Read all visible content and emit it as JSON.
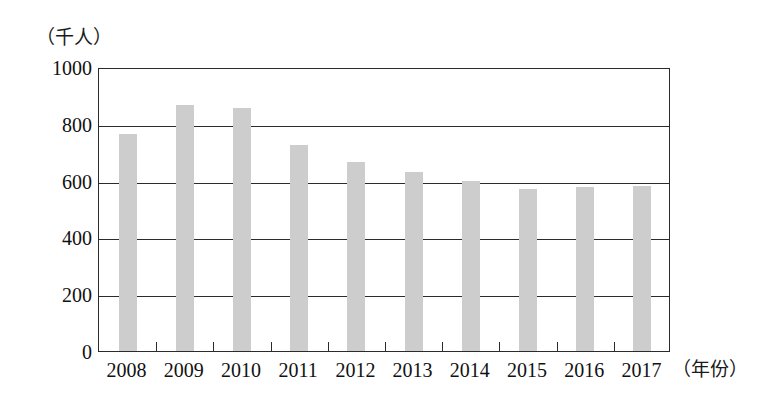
{
  "chart_data": {
    "type": "bar",
    "title": "",
    "subtitle": "",
    "xlabel": "（年份）",
    "ylabel": "（千人）",
    "categories": [
      "2008",
      "2009",
      "2010",
      "2011",
      "2012",
      "2013",
      "2014",
      "2015",
      "2016",
      "2017"
    ],
    "values": [
      765,
      865,
      855,
      725,
      665,
      630,
      600,
      570,
      578,
      580
    ],
    "series": [
      {
        "name": "人数",
        "values": [
          765,
          865,
          855,
          725,
          665,
          630,
          600,
          570,
          578,
          580
        ]
      }
    ],
    "ylim": [
      0,
      1000
    ],
    "yticks": [
      0,
      200,
      400,
      600,
      800,
      1000
    ],
    "ytick_labels": [
      "0",
      "200",
      "400",
      "600",
      "800",
      "1000"
    ],
    "grid": true,
    "grid_axis": "y",
    "legend": false,
    "legend_position": "none",
    "bar_color": "#cdcdcd",
    "axis_color": "#2b2b2b",
    "background": "#ffffff"
  },
  "axes": {
    "y_unit_caption": "（千人）",
    "x_unit_caption": "（年份）"
  }
}
